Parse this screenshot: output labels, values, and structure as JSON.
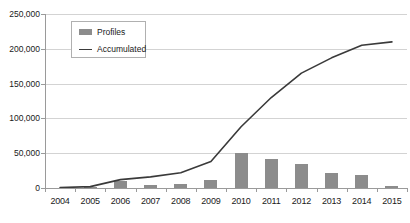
{
  "chart_data": {
    "type": "bar",
    "title": "",
    "subtitle": "",
    "xlabel": "",
    "ylabel": "",
    "categories": [
      "2004",
      "2005",
      "2006",
      "2007",
      "2008",
      "2009",
      "2010",
      "2011",
      "2012",
      "2013",
      "2014",
      "2015"
    ],
    "series": [
      {
        "name": "Profiles",
        "type": "bar",
        "color": "#8c8c8c",
        "values": [
          300,
          1200,
          10000,
          4000,
          6000,
          12000,
          50000,
          42000,
          35000,
          22000,
          18000,
          3000
        ]
      },
      {
        "name": "Accumulated",
        "type": "line",
        "color": "#3a3a3a",
        "values": [
          500,
          2000,
          12000,
          16000,
          22000,
          38000,
          88000,
          130000,
          165000,
          187000,
          205000,
          210000
        ]
      }
    ],
    "ylim": [
      0,
      250000
    ],
    "ytick_values": [
      0,
      50000,
      100000,
      150000,
      200000,
      250000
    ],
    "ytick_labels": [
      "0",
      "50,000",
      "100,000",
      "150,000",
      "200,000",
      "250,000"
    ],
    "grid": true,
    "grid_axis": "y",
    "legend_position": "top-left-inset",
    "legend_entries": [
      "Profiles",
      "Accumulated"
    ]
  },
  "legend": {
    "profiles_label": "Profiles",
    "accumulated_label": "Accumulated"
  }
}
